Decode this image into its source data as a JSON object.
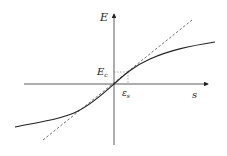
{
  "diagram": {
    "type": "stress-strain curve with tangent",
    "axes": {
      "x_label": "s",
      "y_label": "E"
    },
    "annotations": {
      "y_marker_label": "E",
      "y_marker_sub": "c",
      "x_marker_label": "ε",
      "x_marker_sub": "s"
    },
    "curves": [
      {
        "name": "response-curve",
        "style": "solid",
        "shape": "odd-symmetric saturating S-curve through origin"
      },
      {
        "name": "tangent-line",
        "style": "dashed",
        "shape": "straight line through origin, tangent at origin"
      }
    ],
    "colors": {
      "line": "#222222",
      "guide": "#666666"
    }
  }
}
